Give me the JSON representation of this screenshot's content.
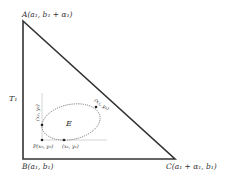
{
  "diagram": {
    "title": "",
    "triangle": {
      "name": "T₁",
      "vertices": {
        "A": {
          "label": "A(a₁, b₁ + α₁)"
        },
        "B": {
          "label": "B(a₁, b₁)"
        },
        "C": {
          "label": "C(a₁ + α₁, b₁)"
        }
      }
    },
    "ellipse": {
      "name": "E",
      "points": {
        "left": {
          "label": "(x₂, y₂)"
        },
        "bottom": {
          "label": "(x₁, y₁)"
        },
        "top_right": {
          "label": "(x₃, y₃)"
        },
        "P": {
          "label": "P(x₀, y₀)"
        }
      }
    },
    "colors": {
      "stroke": "#333333",
      "dotted": "#777777",
      "guide": "#bbbbbb"
    }
  }
}
